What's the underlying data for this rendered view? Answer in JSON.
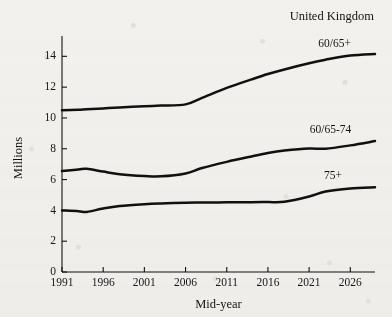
{
  "chart_data": {
    "type": "line",
    "title": "United Kingdom",
    "xlabel": "Mid-year",
    "ylabel": "Millions",
    "xlim": [
      1991,
      2029
    ],
    "ylim": [
      0,
      14.8
    ],
    "yticks": [
      "0",
      "2",
      "4",
      "6",
      "8",
      "10",
      "12",
      "14"
    ],
    "ytick_values": [
      0,
      2,
      4,
      6,
      8,
      10,
      12,
      14
    ],
    "xticks": [
      "1991",
      "1996",
      "2001",
      "2006",
      "2011",
      "2016",
      "2021",
      "2026"
    ],
    "xtick_values": [
      1991,
      1996,
      2001,
      2006,
      2011,
      2016,
      2021,
      2026
    ],
    "grid": false,
    "legend": "inline-labels",
    "line_color": "#101010",
    "background_color": "#f2f1ee",
    "x": [
      1991,
      1993,
      1994,
      1996,
      1998,
      2001,
      2003,
      2006,
      2008,
      2011,
      2014,
      2016,
      2018,
      2021,
      2023,
      2026,
      2029
    ],
    "series": [
      {
        "name": "60/65+",
        "label": "60/65+",
        "label_x": 2024.1,
        "label_y": 14.62,
        "values": [
          10.5,
          10.54,
          10.57,
          10.62,
          10.68,
          10.76,
          10.8,
          10.88,
          11.3,
          11.95,
          12.5,
          12.85,
          13.15,
          13.55,
          13.78,
          14.05,
          14.15
        ]
      },
      {
        "name": "60/65-74",
        "label": "60/65-74",
        "label_x": 2023.6,
        "label_y": 9.05,
        "values": [
          6.55,
          6.66,
          6.7,
          6.52,
          6.35,
          6.23,
          6.21,
          6.4,
          6.75,
          7.15,
          7.5,
          7.72,
          7.88,
          8.02,
          8.0,
          8.22,
          8.5
        ]
      },
      {
        "name": "75+",
        "label": "75+",
        "label_x": 2023.9,
        "label_y": 6.02,
        "values": [
          4.0,
          3.95,
          3.9,
          4.12,
          4.28,
          4.4,
          4.45,
          4.5,
          4.51,
          4.52,
          4.53,
          4.54,
          4.56,
          4.9,
          5.22,
          5.42,
          5.5
        ]
      }
    ]
  }
}
